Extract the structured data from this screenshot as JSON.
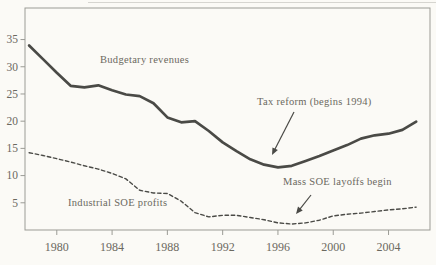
{
  "figure": {
    "background": "#fbfaf6",
    "line_color": "#4a4a46",
    "text_color": "#6b695f",
    "axis_color": "#9b9b95"
  },
  "chart_data": {
    "type": "line",
    "title": "",
    "xlabel": "",
    "ylabel": "",
    "grid": false,
    "legend_position": "in-plot text labels",
    "x": [
      1978,
      1979,
      1980,
      1981,
      1982,
      1983,
      1984,
      1985,
      1986,
      1987,
      1988,
      1989,
      1990,
      1991,
      1992,
      1993,
      1994,
      1995,
      1996,
      1997,
      1998,
      1999,
      2000,
      2001,
      2002,
      2003,
      2004,
      2005,
      2006
    ],
    "series": [
      {
        "name": "Budgetary revenues",
        "line_style": "solid",
        "values": [
          33.9,
          31.4,
          28.9,
          26.5,
          26.2,
          26.6,
          25.7,
          24.9,
          24.6,
          23.3,
          20.7,
          19.8,
          20.0,
          18.2,
          16.1,
          14.5,
          13.0,
          12.0,
          11.5,
          11.8,
          12.7,
          13.6,
          14.6,
          15.6,
          16.8,
          17.4,
          17.7,
          18.4,
          19.9
        ]
      },
      {
        "name": "Industrial SOE profits",
        "line_style": "dashed",
        "values": [
          14.2,
          13.7,
          13.1,
          12.5,
          11.8,
          11.2,
          10.4,
          9.4,
          7.3,
          6.8,
          6.7,
          5.3,
          3.2,
          2.4,
          2.7,
          2.7,
          2.3,
          1.9,
          1.3,
          1.1,
          1.3,
          1.8,
          2.6,
          2.9,
          3.1,
          3.4,
          3.7,
          3.9,
          4.2
        ]
      }
    ],
    "xticks": [
      1980,
      1984,
      1988,
      1992,
      1996,
      2000,
      2004
    ],
    "yticks": [
      5,
      10,
      15,
      20,
      25,
      30,
      35
    ],
    "xlim": [
      1977.7,
      2007.0
    ],
    "ylim": [
      0,
      40.8
    ],
    "annotations": [
      {
        "text": "Budgetary revenues",
        "x": 100,
        "y": 54
      },
      {
        "text": "Industrial SOE profits",
        "x": 68,
        "y": 197
      },
      {
        "text": "Tax reform (begins 1994)",
        "x": 257,
        "y": 96,
        "arrow": {
          "from": [
            294,
            112
          ],
          "to": [
            272,
            155
          ]
        }
      },
      {
        "text": "Mass SOE layoffs begin",
        "x": 283,
        "y": 176,
        "arrow": {
          "from": [
            311,
            195
          ],
          "to": [
            296,
            214
          ]
        }
      }
    ]
  }
}
